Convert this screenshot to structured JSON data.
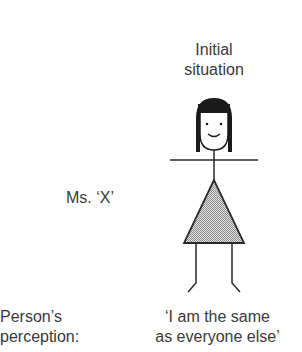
{
  "diagram": {
    "title_line1": "Initial",
    "title_line2": "situation",
    "figure_name": "Ms. ‘X’",
    "perception_label_line1": "Person’s",
    "perception_label_line2": "perception:",
    "perception_quote_line1": "‘I am the same",
    "perception_quote_line2": "as everyone else’",
    "figure": {
      "type": "stick-figure-woman",
      "hair": "black bob",
      "expression": "smiling",
      "dress": "dotted-grey triangle"
    },
    "colors": {
      "text": "#3a3a3a",
      "line": "#2a2a2a",
      "hair": "#1a1a1a",
      "dress_fill": "#bdbdbd"
    }
  }
}
